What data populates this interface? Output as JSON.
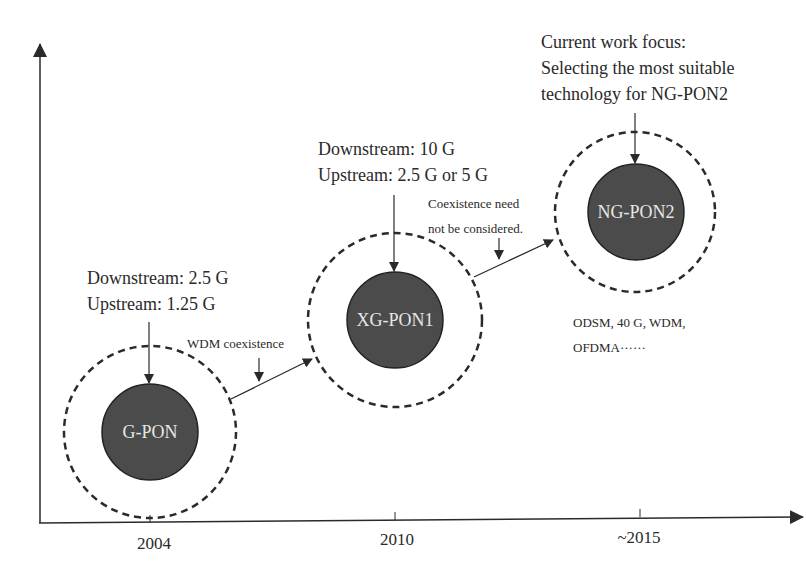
{
  "diagram": {
    "type": "timeline",
    "colors": {
      "line": "#2a2a2a",
      "node_fill": "#4d4d4d",
      "node_text": "#e6e6e6",
      "background": "#ffffff"
    },
    "axis": {
      "x_ticks": [
        "2004",
        "2010",
        "~2015"
      ]
    },
    "nodes": [
      {
        "id": "gpon",
        "label": "G-PON",
        "specs": [
          "Downstream: 2.5 G",
          "Upstream: 1.25 G"
        ]
      },
      {
        "id": "xgpon1",
        "label": "XG-PON1",
        "specs": [
          "Downstream: 10 G",
          "Upstream: 2.5 G or 5 G"
        ]
      },
      {
        "id": "ngpon2",
        "label": "NG-PON2",
        "specs": [
          "Current work focus:",
          "Selecting the most suitable",
          "technology for NG-PON2"
        ],
        "candidates": [
          "ODSM, 40 G, WDM,",
          "OFDMA······"
        ]
      }
    ],
    "transitions": [
      {
        "from": "gpon",
        "to": "xgpon1",
        "label": [
          "WDM coexistence"
        ]
      },
      {
        "from": "xgpon1",
        "to": "ngpon2",
        "label": [
          "Coexistence need",
          "not be considered."
        ]
      }
    ]
  }
}
